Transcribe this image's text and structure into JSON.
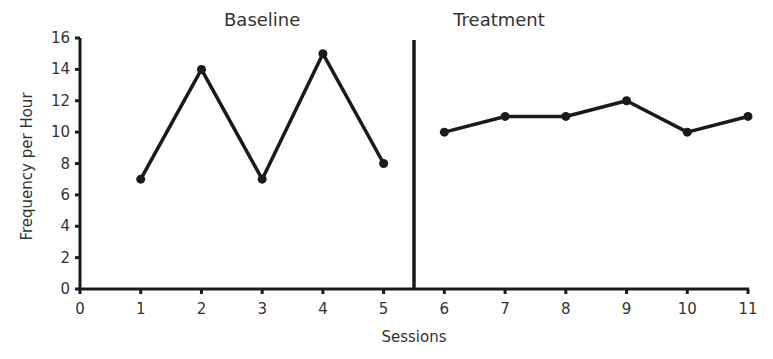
{
  "chart_data": {
    "type": "line",
    "title": "",
    "xlabel": "Sessions",
    "ylabel": "Frequency per Hour",
    "xlim": [
      0,
      11
    ],
    "ylim": [
      0,
      16
    ],
    "x_ticks": [
      0,
      1,
      2,
      3,
      4,
      5,
      6,
      7,
      8,
      9,
      10,
      11
    ],
    "y_ticks": [
      0,
      2,
      4,
      6,
      8,
      10,
      12,
      14,
      16
    ],
    "grid": false,
    "legend": null,
    "phase_change_line_x": 5.5,
    "annotations": [
      {
        "text": "Baseline",
        "x": 3
      },
      {
        "text": "Treatment",
        "x": 6.9
      }
    ],
    "series": [
      {
        "name": "Baseline",
        "x": [
          1,
          2,
          3,
          4,
          5
        ],
        "values": [
          7,
          14,
          7,
          15,
          8
        ]
      },
      {
        "name": "Treatment",
        "x": [
          6,
          7,
          8,
          9,
          10,
          11
        ],
        "values": [
          10,
          11,
          11,
          12,
          10,
          11
        ]
      }
    ],
    "color": "#1a1a1a"
  }
}
